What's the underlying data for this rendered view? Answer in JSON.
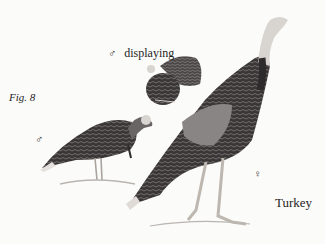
{
  "figure": {
    "label": "Fig. 8",
    "title": "Turkey"
  },
  "birds": {
    "displaying_male": {
      "symbol": "♂",
      "caption": "displaying"
    },
    "walking_male": {
      "symbol": "♂"
    },
    "female": {
      "symbol": "♀"
    }
  },
  "colors": {
    "background": "#fbfbf9",
    "plumage_dark": "#2e2b2c",
    "plumage_mid": "#5e5a5a",
    "head_light": "#d8d4d0",
    "legs": "#bdb7b0"
  }
}
